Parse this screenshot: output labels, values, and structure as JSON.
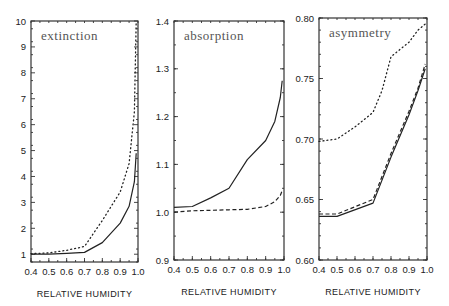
{
  "chart_data": [
    {
      "type": "line",
      "title": "extinction",
      "xlabel": "RELATIVE HUMIDITY",
      "ylabel": "",
      "xlim": [
        0.4,
        1.0
      ],
      "ylim": [
        0.7,
        10
      ],
      "xticks": [
        0.4,
        0.5,
        0.6,
        0.7,
        0.8,
        0.9,
        1.0
      ],
      "xtick_labels": [
        "0.4",
        "0.5",
        "0.6",
        "0.7",
        "0.8",
        "0.9",
        "1.0"
      ],
      "yticks": [
        1,
        2,
        3,
        4,
        5,
        6,
        7,
        8,
        9,
        10
      ],
      "ytick_labels": [
        "1",
        "2",
        "3",
        "4",
        "5",
        "6",
        "7",
        "8",
        "9",
        "10"
      ],
      "yminor": 0.5,
      "xminor": 0.05,
      "frame": {
        "x": 31,
        "y": 21,
        "w": 107,
        "h": 241
      },
      "series": [
        {
          "name": "solid",
          "style": "solid",
          "x": [
            0.4,
            0.5,
            0.6,
            0.7,
            0.8,
            0.9,
            0.95,
            0.98,
            0.99
          ],
          "values": [
            1.0,
            1.0,
            1.03,
            1.07,
            1.45,
            2.2,
            2.85,
            3.8,
            4.9
          ]
        },
        {
          "name": "dotted",
          "style": "dotted",
          "x": [
            0.4,
            0.5,
            0.6,
            0.7,
            0.8,
            0.9,
            0.95,
            0.98,
            0.99
          ],
          "values": [
            1.02,
            1.05,
            1.15,
            1.3,
            2.3,
            3.4,
            4.5,
            6.5,
            10.0
          ]
        }
      ]
    },
    {
      "type": "line",
      "title": "absorption",
      "xlabel": "RELATIVE HUMIDITY",
      "ylabel": "",
      "xlim": [
        0.4,
        1.0
      ],
      "ylim": [
        0.9,
        1.4
      ],
      "xticks": [
        0.4,
        0.5,
        0.6,
        0.7,
        0.8,
        0.9,
        1.0
      ],
      "xtick_labels": [
        "0.4",
        "0.5",
        "0.6",
        "0.7",
        "0.8",
        "0.9",
        "1.0"
      ],
      "yticks": [
        0.9,
        1.0,
        1.1,
        1.2,
        1.3,
        1.4
      ],
      "ytick_labels": [
        "0.9",
        "1.0",
        "1.1",
        "1.2",
        "1.3",
        "1.4"
      ],
      "yminor": 0.05,
      "xminor": 0.05,
      "frame": {
        "x": 174,
        "y": 21,
        "w": 110,
        "h": 239
      },
      "series": [
        {
          "name": "solid",
          "style": "solid",
          "x": [
            0.4,
            0.5,
            0.6,
            0.7,
            0.8,
            0.9,
            0.95,
            0.98,
            0.99
          ],
          "values": [
            1.01,
            1.012,
            1.03,
            1.05,
            1.11,
            1.15,
            1.19,
            1.24,
            1.275
          ]
        },
        {
          "name": "dashed",
          "style": "dashed",
          "x": [
            0.4,
            0.5,
            0.6,
            0.7,
            0.8,
            0.9,
            0.95,
            0.98,
            0.99
          ],
          "values": [
            1.0,
            1.003,
            1.004,
            1.005,
            1.006,
            1.012,
            1.022,
            1.035,
            1.045
          ]
        }
      ]
    },
    {
      "type": "line",
      "title": "asymmetry",
      "xlabel": "RELATIVE HUMIDITY",
      "ylabel": "",
      "xlim": [
        0.4,
        1.0
      ],
      "ylim": [
        0.6,
        0.8
      ],
      "xticks": [
        0.4,
        0.5,
        0.6,
        0.7,
        0.8,
        0.9,
        1.0
      ],
      "xtick_labels": [
        "0.4",
        "0.5",
        "0.6",
        "0.7",
        "0.8",
        "0.9",
        "1.0"
      ],
      "yticks": [
        0.6,
        0.65,
        0.7,
        0.75,
        0.8
      ],
      "ytick_labels": [
        "0.60",
        "0.65",
        "0.70",
        "0.75",
        "0.80"
      ],
      "yminor": 0.01,
      "xminor": 0.05,
      "frame": {
        "x": 319,
        "y": 18,
        "w": 108,
        "h": 242
      },
      "series": [
        {
          "name": "solid",
          "style": "solid",
          "x": [
            0.4,
            0.5,
            0.7,
            0.8,
            0.9,
            0.95,
            0.99
          ],
          "values": [
            0.636,
            0.636,
            0.647,
            0.685,
            0.72,
            0.74,
            0.758
          ]
        },
        {
          "name": "dashed",
          "style": "dashed",
          "x": [
            0.4,
            0.5,
            0.7,
            0.8,
            0.9,
            0.95,
            0.99
          ],
          "values": [
            0.638,
            0.638,
            0.65,
            0.688,
            0.723,
            0.742,
            0.762
          ]
        },
        {
          "name": "dotted",
          "style": "dotted",
          "x": [
            0.4,
            0.5,
            0.6,
            0.7,
            0.75,
            0.8,
            0.9,
            0.95,
            0.99
          ],
          "values": [
            0.698,
            0.7,
            0.71,
            0.722,
            0.74,
            0.768,
            0.78,
            0.79,
            0.795
          ]
        }
      ]
    }
  ]
}
